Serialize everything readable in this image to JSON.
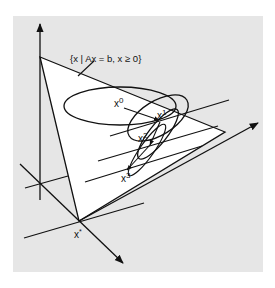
{
  "figure": {
    "set_label": "{x | Ax = b, x ≥ 0}",
    "iterates": [
      {
        "name": "x",
        "sup": "0"
      },
      {
        "name": "x",
        "sup": "1"
      },
      {
        "name": "x",
        "sup": "2"
      },
      {
        "name": "x",
        "sup": "3"
      }
    ],
    "optimum": {
      "name": "x",
      "sup": "*"
    },
    "colors": {
      "background": "#e6e6e6",
      "feasible_region": "#ffffff",
      "stroke": "#111111"
    }
  }
}
